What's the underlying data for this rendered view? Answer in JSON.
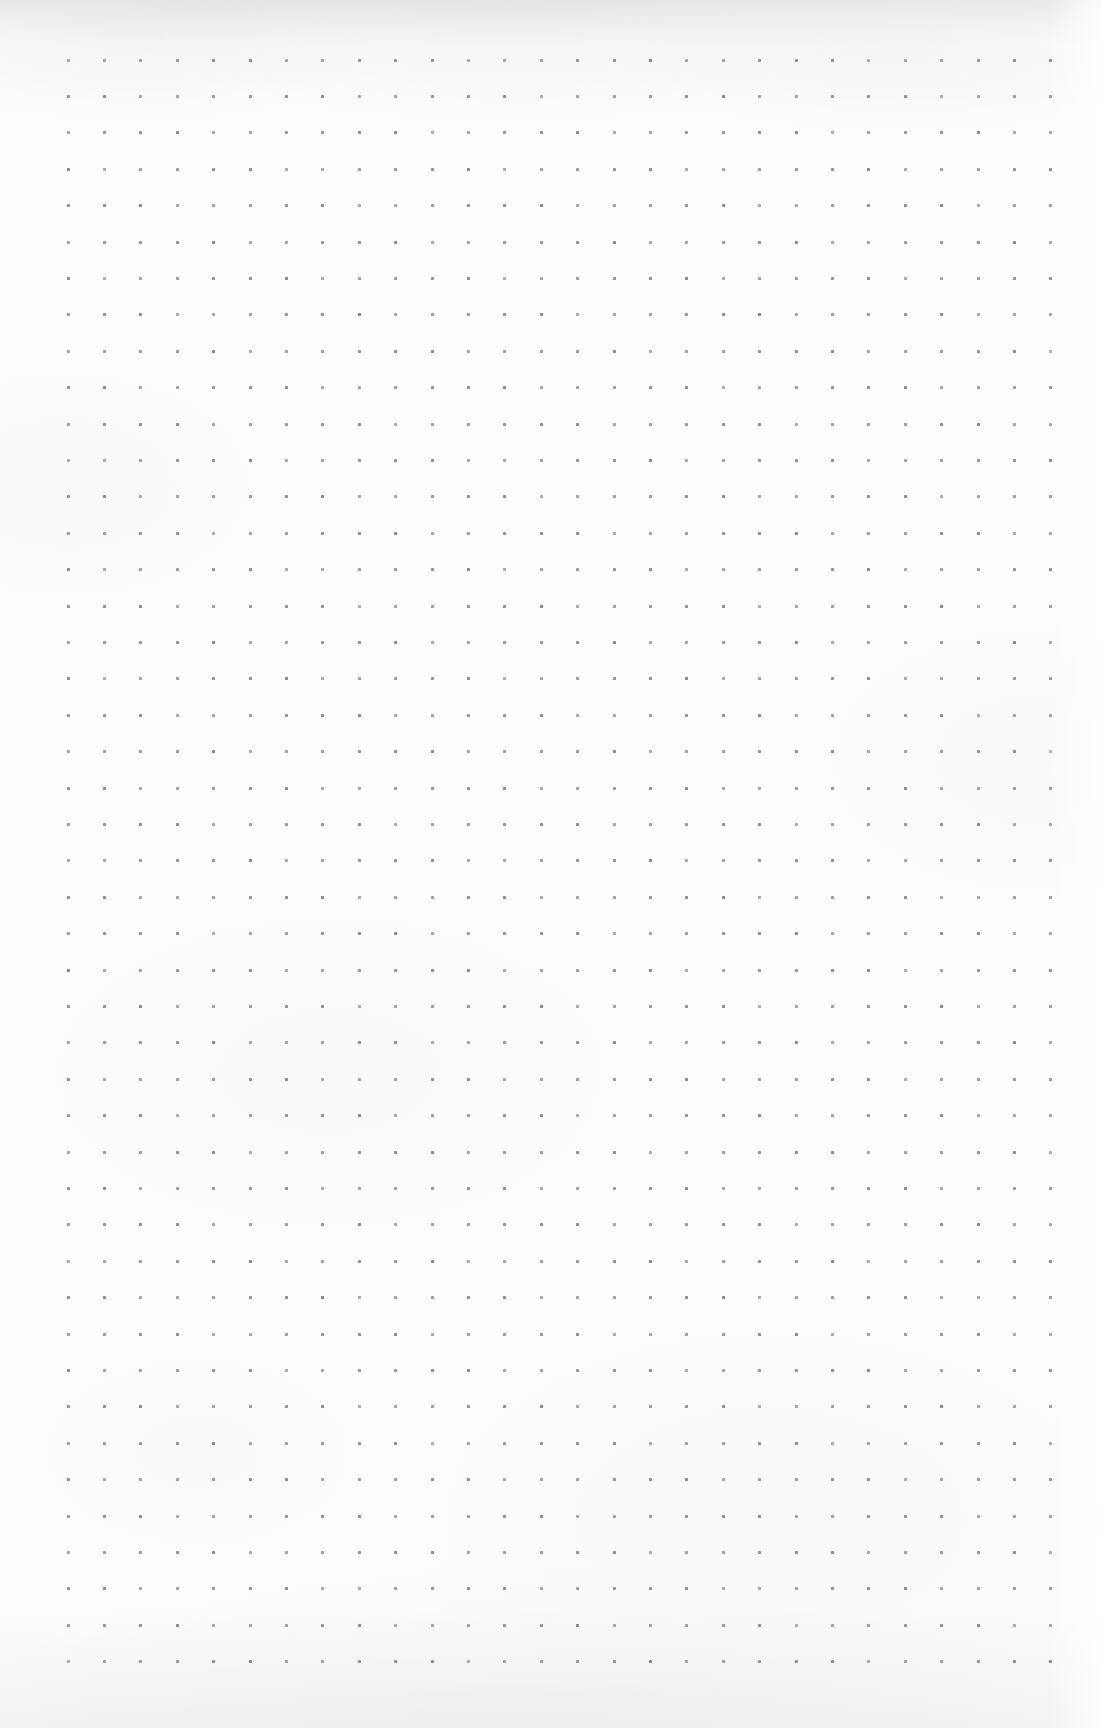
{
  "page": {
    "kind": "dot-grid-paper-scan",
    "width": 1101,
    "height": 1728,
    "background_color": "#fdfdfd",
    "paper_tint": "#fdfdfd",
    "has_text": false,
    "has_handwriting": false,
    "has_ui_chrome": false,
    "title": "",
    "visible_text": []
  },
  "grid": {
    "dot_color": "#8a8a92",
    "dot_size_px": 3,
    "dot_shape": "square",
    "spacing_x_px": 36.4,
    "spacing_y_px": 36.4,
    "origin_x_px": 68,
    "origin_y_px": 60,
    "columns": 28,
    "rows": 45,
    "margin_left_px": 68,
    "margin_right_px": 36,
    "margin_top_px": 60,
    "margin_bottom_px": 78
  },
  "texture": {
    "top_edge_shadow_color": "#8c8e96",
    "right_edge_highlight_color": "#ffffff",
    "bottom_edge_shadow_color": "#92949c"
  }
}
